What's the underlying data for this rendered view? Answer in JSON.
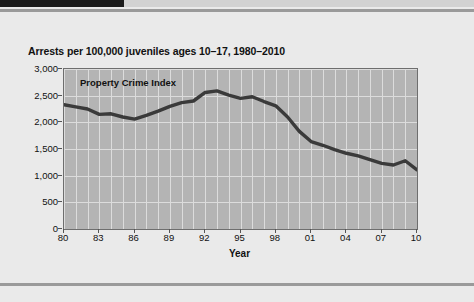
{
  "page": {
    "background_color": "#eaeaea"
  },
  "decoration": {
    "top_bar_dark_color": "#1b1b1b",
    "top_bar_light_color": "#d2d2d2",
    "rule_color": "#9a9a9a"
  },
  "figure": {
    "title": "Arrests per 100,000 juveniles ages 10–17, 1980–2010",
    "series_label": "Property Crime Index",
    "xaxis_title": "Year",
    "plot_background_color": "#b4b4b4",
    "grid_color": "#dcdcdc",
    "line_color": "#3a3a3a"
  },
  "chart_data": {
    "type": "line",
    "title": "Arrests per 100,000 juveniles ages 10–17, 1980–2010",
    "xlabel": "Year",
    "ylabel": "",
    "ylim": [
      0,
      3000
    ],
    "xlim": [
      1980,
      2010
    ],
    "grid": true,
    "legend_position": "inside-top-left",
    "ytick_labels": [
      "0",
      "500",
      "1,000",
      "1,500",
      "2,000",
      "2,500",
      "3,000"
    ],
    "ytick_values": [
      0,
      500,
      1000,
      1500,
      2000,
      2500,
      3000
    ],
    "xtick_labels": [
      "80",
      "83",
      "86",
      "89",
      "92",
      "95",
      "98",
      "01",
      "04",
      "07",
      "10"
    ],
    "xtick_values": [
      1980,
      1983,
      1986,
      1989,
      1992,
      1995,
      1998,
      2001,
      2004,
      2007,
      2010
    ],
    "series": [
      {
        "name": "Property Crime Index",
        "x": [
          1980,
          1981,
          1982,
          1983,
          1984,
          1985,
          1986,
          1987,
          1988,
          1989,
          1990,
          1991,
          1992,
          1993,
          1994,
          1995,
          1996,
          1997,
          1998,
          1999,
          2000,
          2001,
          2002,
          2003,
          2004,
          2005,
          2006,
          2007,
          2008,
          2009,
          2010
        ],
        "values": [
          2330,
          2290,
          2250,
          2150,
          2160,
          2100,
          2060,
          2130,
          2210,
          2300,
          2370,
          2400,
          2560,
          2590,
          2510,
          2450,
          2480,
          2390,
          2310,
          2100,
          1830,
          1640,
          1570,
          1490,
          1420,
          1370,
          1300,
          1230,
          1200,
          1280,
          1110
        ]
      }
    ]
  }
}
